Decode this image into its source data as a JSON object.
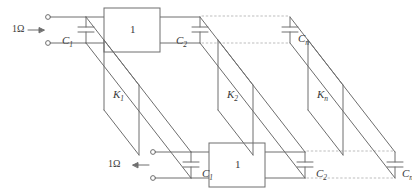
{
  "figure": {
    "type": "circuit-diagram",
    "stroke_color": "#6e6e6e",
    "text_color": "#3a3a3a",
    "dotted_color": "#b9b9b9"
  },
  "labels": {
    "top_port": "1Ω",
    "bottom_port": "1Ω",
    "top_arrow": "→",
    "bottom_arrow": "←",
    "cap_top_1": {
      "name": "C",
      "sub": "1"
    },
    "cap_top_2": {
      "name": "C",
      "sub": "2"
    },
    "cap_top_n": {
      "name": "C",
      "sub": "n"
    },
    "cap_bot_1": {
      "name": "C",
      "sub": "1"
    },
    "cap_bot_2": {
      "name": "C",
      "sub": "2"
    },
    "cap_bot_n": {
      "name": "C",
      "sub": "n"
    },
    "block_top": "1",
    "block_bottom": "1",
    "coupler_1": {
      "name": "K",
      "sub": "1"
    },
    "coupler_2": {
      "name": "K",
      "sub": "2"
    },
    "coupler_n": {
      "name": "K",
      "sub": "n"
    }
  },
  "elements": {
    "terminals": [
      {
        "name": "top-input-upper",
        "x": 47,
        "y": 17
      },
      {
        "name": "top-input-lower",
        "x": 47,
        "y": 43
      },
      {
        "name": "bottom-output-upper",
        "x": 152,
        "y": 152
      },
      {
        "name": "bottom-output-lower",
        "x": 152,
        "y": 178
      }
    ],
    "capacitors": [
      {
        "name": "C1-top",
        "x": 86,
        "y": 30
      },
      {
        "name": "C2-top",
        "x": 200,
        "y": 30
      },
      {
        "name": "Cn-top",
        "x": 290,
        "y": 30
      },
      {
        "name": "C1-bottom",
        "x": 191,
        "y": 165
      },
      {
        "name": "C2-bottom",
        "x": 305,
        "y": 165
      },
      {
        "name": "Cn-bottom",
        "x": 395,
        "y": 165
      }
    ],
    "blocks": [
      {
        "name": "block-top",
        "x": 104,
        "y": 8,
        "w": 56,
        "h": 44
      },
      {
        "name": "block-bottom",
        "x": 209,
        "y": 143,
        "w": 56,
        "h": 44
      }
    ],
    "couplers": [
      {
        "name": "K1",
        "x": 95,
        "y": 95
      },
      {
        "name": "K2",
        "x": 215,
        "y": 95
      },
      {
        "name": "Kn",
        "x": 330,
        "y": 95
      }
    ]
  }
}
